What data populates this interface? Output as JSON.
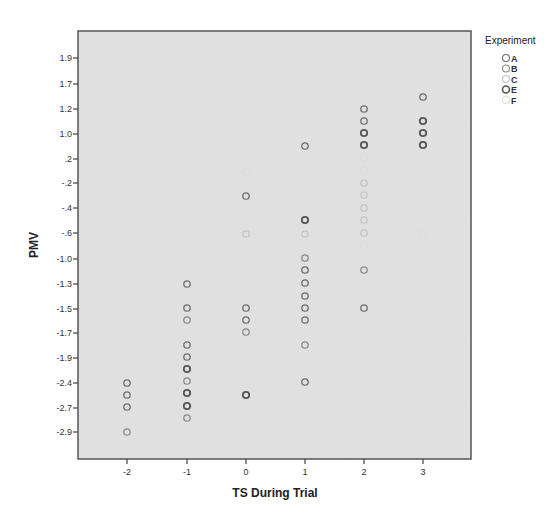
{
  "chart_data": {
    "type": "scatter",
    "title": "",
    "xlabel": "TS During Trial",
    "ylabel": "PMV",
    "x_ticks": [
      "-2",
      "-1",
      "0",
      "1",
      "2",
      "3"
    ],
    "y_ticks": [
      "1.9",
      "1.7",
      "1.2",
      "1.0",
      ".2",
      "-.2",
      "-.4",
      "-.6",
      "-1.0",
      "-1.3",
      "-1.5",
      "-1.7",
      "-1.9",
      "-2.4",
      "-2.7",
      "-2.9"
    ],
    "grid": false,
    "legend": {
      "title": "Experiment",
      "position": "right",
      "entries": [
        {
          "label": "A",
          "color": "#6e6e6e"
        },
        {
          "label": "B",
          "color": "#8a8a8a"
        },
        {
          "label": "C",
          "color": "#c4c4c4"
        },
        {
          "label": "E",
          "color": "#555555"
        },
        {
          "label": "F",
          "color": "#dddddd"
        }
      ]
    },
    "series": [
      {
        "x": -2,
        "y_values": [
          -2.4,
          -2.55,
          -2.7,
          -2.9
        ]
      },
      {
        "x": -1,
        "y_values": [
          -1.3,
          -1.5,
          -1.6,
          -1.8,
          -1.9,
          -2.0,
          -2.1,
          -2.2,
          -2.2,
          -2.3,
          -2.4
        ]
      },
      {
        "x": 0,
        "y_values": [
          -0.1,
          -0.3,
          -0.6,
          -1.5,
          -1.6,
          -1.65,
          -2.55
        ]
      },
      {
        "x": 1,
        "y_values": [
          0.6,
          -0.5,
          -0.6,
          -0.9,
          -1.05,
          -1.2,
          -1.4,
          -1.5,
          -1.6,
          -1.8,
          -2.4
        ]
      },
      {
        "x": 2,
        "y_values": [
          1.2,
          1.1,
          1.0,
          0.8,
          0.6,
          0.4,
          -0.2,
          -0.3,
          -0.4,
          -0.5,
          -0.6,
          -0.8,
          -1.1,
          -1.5
        ]
      },
      {
        "x": 3,
        "y_values": [
          1.4,
          1.1,
          1.0,
          0.8,
          -0.6
        ]
      }
    ],
    "points_px": [
      {
        "x": -2,
        "py": 383,
        "g": "A"
      },
      {
        "x": -2,
        "py": 395,
        "g": "A"
      },
      {
        "x": -2,
        "py": 407,
        "g": "A"
      },
      {
        "x": -2,
        "py": 432,
        "g": "B"
      },
      {
        "x": -1,
        "py": 284,
        "g": "A"
      },
      {
        "x": -1,
        "py": 308,
        "g": "A"
      },
      {
        "x": -1,
        "py": 320,
        "g": "B"
      },
      {
        "x": -1,
        "py": 345,
        "g": "A"
      },
      {
        "x": -1,
        "py": 357,
        "g": "A"
      },
      {
        "x": -1,
        "py": 369,
        "g": "E"
      },
      {
        "x": -1,
        "py": 381,
        "g": "B"
      },
      {
        "x": -1,
        "py": 393,
        "g": "E"
      },
      {
        "x": -1,
        "py": 406,
        "g": "E"
      },
      {
        "x": -1,
        "py": 418,
        "g": "B"
      },
      {
        "x": 0,
        "py": 172,
        "g": "F"
      },
      {
        "x": 0,
        "py": 196,
        "g": "A"
      },
      {
        "x": 0,
        "py": 234,
        "g": "C"
      },
      {
        "x": 0,
        "py": 308,
        "g": "A"
      },
      {
        "x": 0,
        "py": 320,
        "g": "A"
      },
      {
        "x": 0,
        "py": 332,
        "g": "B"
      },
      {
        "x": 0,
        "py": 395,
        "g": "E"
      },
      {
        "x": 1,
        "py": 146,
        "g": "A"
      },
      {
        "x": 1,
        "py": 220,
        "g": "E"
      },
      {
        "x": 1,
        "py": 234,
        "g": "C"
      },
      {
        "x": 1,
        "py": 258,
        "g": "B"
      },
      {
        "x": 1,
        "py": 270,
        "g": "A"
      },
      {
        "x": 1,
        "py": 283,
        "g": "A"
      },
      {
        "x": 1,
        "py": 296,
        "g": "A"
      },
      {
        "x": 1,
        "py": 308,
        "g": "A"
      },
      {
        "x": 1,
        "py": 320,
        "g": "A"
      },
      {
        "x": 1,
        "py": 345,
        "g": "B"
      },
      {
        "x": 1,
        "py": 382,
        "g": "A"
      },
      {
        "x": 2,
        "py": 109,
        "g": "A"
      },
      {
        "x": 2,
        "py": 121,
        "g": "A"
      },
      {
        "x": 2,
        "py": 133,
        "g": "E"
      },
      {
        "x": 2,
        "py": 145,
        "g": "E"
      },
      {
        "x": 2,
        "py": 158,
        "g": "F"
      },
      {
        "x": 2,
        "py": 170,
        "g": "F"
      },
      {
        "x": 2,
        "py": 183,
        "g": "C"
      },
      {
        "x": 2,
        "py": 195,
        "g": "C"
      },
      {
        "x": 2,
        "py": 208,
        "g": "C"
      },
      {
        "x": 2,
        "py": 220,
        "g": "C"
      },
      {
        "x": 2,
        "py": 233,
        "g": "C"
      },
      {
        "x": 2,
        "py": 245,
        "g": "F"
      },
      {
        "x": 2,
        "py": 270,
        "g": "B"
      },
      {
        "x": 2,
        "py": 308,
        "g": "A"
      },
      {
        "x": 3,
        "py": 97,
        "g": "A"
      },
      {
        "x": 3,
        "py": 121,
        "g": "E"
      },
      {
        "x": 3,
        "py": 133,
        "g": "E"
      },
      {
        "x": 3,
        "py": 145,
        "g": "E"
      },
      {
        "x": 3,
        "py": 233,
        "g": "F"
      }
    ]
  },
  "layout": {
    "plot_area": {
      "left": 78,
      "top": 31,
      "right": 471,
      "bottom": 459,
      "fill": "#e3e3e3",
      "border": "#555555"
    },
    "x_tick_px": [
      127,
      187,
      246,
      305,
      364,
      423
    ],
    "y_tick_px": [
      58,
      84,
      109,
      134,
      159,
      183,
      208,
      233,
      259,
      284,
      309,
      333,
      358,
      383,
      408,
      432
    ]
  }
}
